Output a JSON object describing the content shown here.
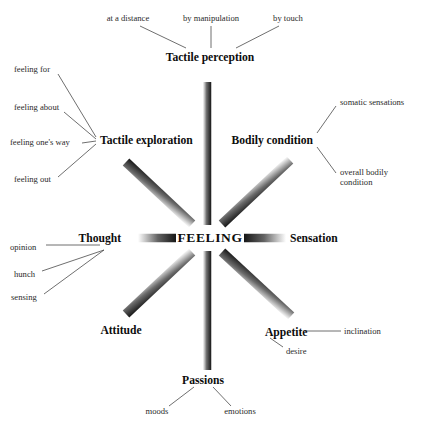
{
  "figure": {
    "hub": {
      "label": "FEELING",
      "x": 210,
      "y": 238
    },
    "colors": {
      "background": "#ffffff",
      "ray_dark": "#1b1b1b",
      "ray_light": "#ffffff",
      "connector_line": "#4a4a4a",
      "primary_text": "#0d0d0d",
      "secondary_text": "#2a2a2a"
    },
    "branches": [
      {
        "id": "tactile-perception",
        "label": "Tactile perception",
        "weight": "primary",
        "x": 210,
        "y": 57,
        "align": "center",
        "ray": {
          "direction": "up",
          "x1": 207,
          "y1": 225,
          "x2": 207,
          "y2": 82
        },
        "leaves": [
          {
            "id": "at-a-distance",
            "label": "at a distance",
            "x": 128,
            "y": 19,
            "align": "center"
          },
          {
            "id": "by-manipulation",
            "label": "by manipulation",
            "x": 211,
            "y": 19,
            "align": "center"
          },
          {
            "id": "by-touch",
            "label": "by touch",
            "x": 288,
            "y": 19,
            "align": "center"
          }
        ]
      },
      {
        "id": "bodily-condition",
        "label": "Bodily condition",
        "weight": "primary",
        "x": 313,
        "y": 140,
        "align": "right",
        "ray": {
          "direction": "up-right",
          "x1": 222,
          "y1": 224,
          "x2": 290,
          "y2": 160
        },
        "leaves": [
          {
            "id": "somatic-sensations",
            "label": "somatic sensations",
            "x": 340,
            "y": 103,
            "align": "left"
          },
          {
            "id": "overall-bodily-condition",
            "label": "overall bodily condition",
            "x": 340,
            "y": 178,
            "align": "left",
            "wrap": true,
            "width": 58
          }
        ]
      },
      {
        "id": "sensation",
        "label": "Sensation",
        "weight": "primary",
        "x": 290,
        "y": 238,
        "align": "left",
        "ray": {
          "direction": "right",
          "x1": 244,
          "y1": 238,
          "x2": 286,
          "y2": 238
        },
        "leaves": []
      },
      {
        "id": "appetite",
        "label": "Appetite",
        "weight": "primary",
        "x": 265,
        "y": 332,
        "align": "left",
        "ray": {
          "direction": "down-right",
          "x1": 222,
          "y1": 252,
          "x2": 291,
          "y2": 316
        },
        "leaves": [
          {
            "id": "inclination",
            "label": "inclination",
            "x": 344,
            "y": 332,
            "align": "left"
          },
          {
            "id": "desire",
            "label": "desire",
            "x": 286,
            "y": 352,
            "align": "left"
          }
        ]
      },
      {
        "id": "passions",
        "label": "Passions",
        "weight": "primary",
        "x": 203,
        "y": 380,
        "align": "center",
        "ray": {
          "direction": "down",
          "x1": 207,
          "y1": 251,
          "x2": 207,
          "y2": 370
        },
        "leaves": [
          {
            "id": "moods",
            "label": "moods",
            "x": 157,
            "y": 412,
            "align": "center"
          },
          {
            "id": "emotions",
            "label": "emotions",
            "x": 240,
            "y": 412,
            "align": "center"
          }
        ]
      },
      {
        "id": "attitude",
        "label": "Attitude",
        "weight": "primary",
        "x": 121,
        "y": 330,
        "align": "center",
        "ray": {
          "direction": "down-left",
          "x1": 192,
          "y1": 252,
          "x2": 126,
          "y2": 314
        },
        "leaves": []
      },
      {
        "id": "thought",
        "label": "Thought",
        "weight": "primary",
        "x": 121,
        "y": 238,
        "align": "right",
        "ray": {
          "direction": "left",
          "x1": 138,
          "y1": 238,
          "x2": 176,
          "y2": 238
        },
        "leaves": [
          {
            "id": "opinion",
            "label": "opinion",
            "x": 10,
            "y": 248,
            "align": "left"
          },
          {
            "id": "hunch",
            "label": "hunch",
            "x": 14,
            "y": 275,
            "align": "left"
          },
          {
            "id": "sensing",
            "label": "sensing",
            "x": 11,
            "y": 298,
            "align": "left"
          }
        ]
      },
      {
        "id": "tactile-exploration",
        "label": "Tactile exploration",
        "weight": "primary",
        "x": 100,
        "y": 140,
        "align": "left",
        "ray": {
          "direction": "up-left",
          "x1": 192,
          "y1": 224,
          "x2": 126,
          "y2": 162
        },
        "leaves": [
          {
            "id": "feeling-for",
            "label": "feeling for",
            "x": 14,
            "y": 70,
            "align": "left"
          },
          {
            "id": "feeling-about",
            "label": "feeling about",
            "x": 14,
            "y": 108,
            "align": "left"
          },
          {
            "id": "feeling-ones-way",
            "label": "feeling one's way",
            "x": 10,
            "y": 143,
            "align": "left"
          },
          {
            "id": "feeling-out",
            "label": "feeling out",
            "x": 14,
            "y": 180,
            "align": "left"
          }
        ]
      }
    ],
    "connectors": [
      {
        "id": "conn-at-a-distance",
        "x1": 140,
        "y1": 26,
        "x2": 186,
        "y2": 48
      },
      {
        "id": "conn-by-manipulation",
        "x1": 211,
        "y1": 26,
        "x2": 211,
        "y2": 48
      },
      {
        "id": "conn-by-touch",
        "x1": 279,
        "y1": 26,
        "x2": 236,
        "y2": 48
      },
      {
        "id": "conn-somatic-sensations",
        "x1": 336,
        "y1": 106,
        "x2": 317,
        "y2": 133
      },
      {
        "id": "conn-overall-bodily",
        "x1": 336,
        "y1": 173,
        "x2": 317,
        "y2": 147
      },
      {
        "id": "conn-inclination",
        "x1": 341,
        "y1": 331,
        "x2": 305,
        "y2": 331
      },
      {
        "id": "conn-desire",
        "x1": 283,
        "y1": 347,
        "x2": 270,
        "y2": 338
      },
      {
        "id": "conn-moods",
        "x1": 169,
        "y1": 406,
        "x2": 194,
        "y2": 387
      },
      {
        "id": "conn-emotions",
        "x1": 231,
        "y1": 406,
        "x2": 213,
        "y2": 387
      },
      {
        "id": "conn-opinion",
        "x1": 46,
        "y1": 245,
        "x2": 100,
        "y2": 245
      },
      {
        "id": "conn-hunch",
        "x1": 42,
        "y1": 271,
        "x2": 104,
        "y2": 250
      },
      {
        "id": "conn-sensing",
        "x1": 44,
        "y1": 294,
        "x2": 104,
        "y2": 250
      },
      {
        "id": "conn-feeling-for",
        "x1": 58,
        "y1": 74,
        "x2": 96,
        "y2": 137
      },
      {
        "id": "conn-feeling-about",
        "x1": 64,
        "y1": 112,
        "x2": 96,
        "y2": 139
      },
      {
        "id": "conn-feeling-ones-way",
        "x1": 82,
        "y1": 143,
        "x2": 96,
        "y2": 141
      },
      {
        "id": "conn-feeling-out",
        "x1": 58,
        "y1": 177,
        "x2": 96,
        "y2": 144
      }
    ]
  }
}
